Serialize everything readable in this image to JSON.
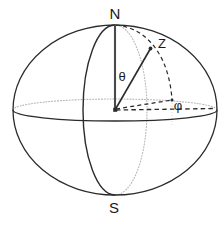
{
  "figure": {
    "background_color": "#ffffff",
    "stroke_color": "#2b2b2b",
    "hidden_stroke_color": "#b9b9b9",
    "label_color": "#1a1a1a"
  },
  "labels": {
    "north_pole": "N",
    "south_pole": "S",
    "point": "Z",
    "polar_angle": "θ",
    "azimuth_angle": "φ"
  },
  "geometry": {
    "sphere": {
      "center_x": 115,
      "center_y": 110,
      "radius_x": 102,
      "radius_y": 85
    },
    "equator": {
      "center_x": 115,
      "center_y": 110,
      "radius_x": 102,
      "radius_y": 11,
      "front_style": "solid",
      "back_style": "dotted"
    },
    "meridian": {
      "center_x": 115,
      "center_y": 110,
      "radius_x": 32,
      "radius_y": 85,
      "front_style": "solid",
      "back_style": "dotted"
    },
    "polar_axis": {
      "from_x": 115,
      "from_y": 25,
      "to_x": 115,
      "to_y": 110,
      "style": "solid"
    },
    "radius_vector": {
      "from_x": 115,
      "from_y": 110,
      "to_x": 150,
      "to_y": 49,
      "style": "solid"
    },
    "point_z": {
      "x": 150,
      "y": 49
    },
    "foot_point": {
      "x": 172,
      "y": 100
    },
    "reference_point": {
      "x": 216,
      "y": 108
    },
    "center_point": {
      "x": 115,
      "y": 110
    }
  },
  "label_positions": {
    "north_pole": {
      "x": 115,
      "y": 19
    },
    "south_pole": {
      "x": 114,
      "y": 213
    },
    "point": {
      "x": 162,
      "y": 48
    },
    "polar_angle": {
      "x": 122,
      "y": 81
    },
    "azimuth_angle": {
      "x": 178,
      "y": 110
    }
  }
}
